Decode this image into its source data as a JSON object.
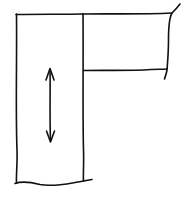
{
  "diagram": {
    "kind": "hand-drawn sketch",
    "colors": {
      "background": "#ffffff",
      "ink": "#111111"
    },
    "stroke_width": 1.6,
    "elements": [
      {
        "id": "left-panel",
        "shape": "rectangle",
        "edges": {
          "left": 16,
          "right": 83,
          "top": 14,
          "bottom": 183
        },
        "bottom_edge_style": "wavy-torn"
      },
      {
        "id": "top-right-panel",
        "shape": "rectangle",
        "edges": {
          "left": 83,
          "right": 172,
          "top": 14,
          "bottom": 70
        },
        "right_edge_style": "broken-overshoot"
      },
      {
        "id": "vertical-arrow",
        "shape": "double-headed-arrow",
        "x": 50,
        "y_start": 68,
        "y_end": 142,
        "direction": "vertical"
      }
    ],
    "labels": []
  }
}
